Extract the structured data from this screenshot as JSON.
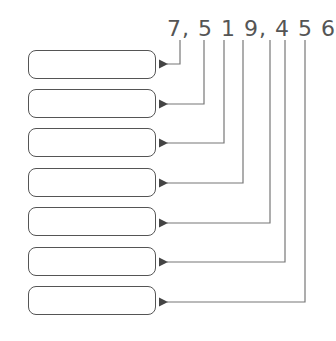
{
  "number": "7, 5 1 9, 4 5 6",
  "digits": [
    "7",
    "5",
    "1",
    "9",
    "4",
    "5",
    "6"
  ],
  "boxes": [
    {
      "value": ""
    },
    {
      "value": ""
    },
    {
      "value": ""
    },
    {
      "value": ""
    },
    {
      "value": ""
    },
    {
      "value": ""
    },
    {
      "value": ""
    }
  ],
  "colors": {
    "line": "#777777",
    "box_border": "#555555",
    "text": "#555555"
  }
}
